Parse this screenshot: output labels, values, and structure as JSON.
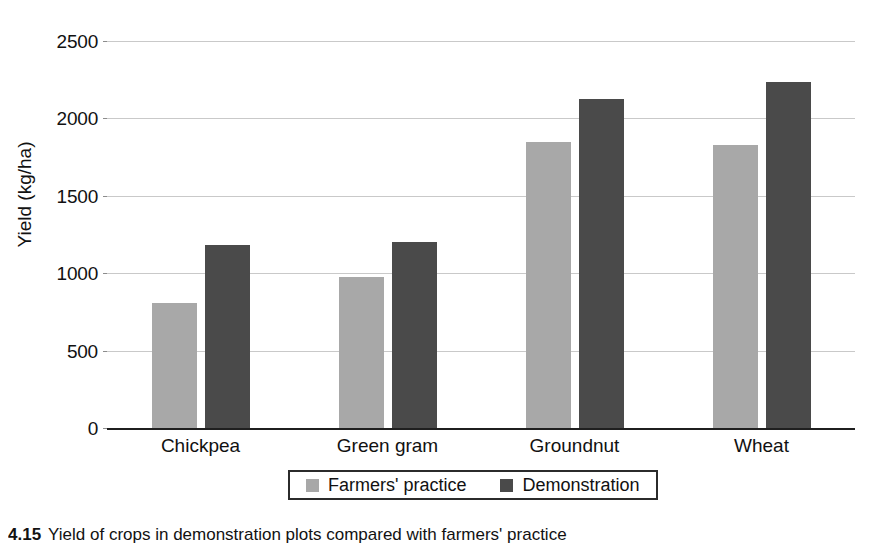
{
  "chart_data": {
    "type": "bar",
    "title": "",
    "subtitle": "",
    "xlabel": "",
    "ylabel": "Yield (kg/ha)",
    "ylim": [
      0,
      2500
    ],
    "ytick_values": [
      0,
      500,
      1000,
      1500,
      2000,
      2500
    ],
    "ytick_labels": [
      "0",
      "500",
      "1000",
      "1500",
      "2000",
      "2500"
    ],
    "grid": true,
    "grid_axis": "y",
    "legend_position": "bottom-center",
    "categories": [
      "Chickpea",
      "Green gram",
      "Groundnut",
      "Wheat"
    ],
    "series": [
      {
        "name": "Farmers' practice",
        "color": "#a8a8a8",
        "values": [
          810,
          975,
          1850,
          1830
        ]
      },
      {
        "name": "Demonstration",
        "color": "#4a4a4a",
        "values": [
          1185,
          1200,
          2125,
          2235
        ]
      }
    ]
  },
  "caption": {
    "number": "4.15",
    "text": "Yield of crops in demonstration plots compared with farmers' practice"
  },
  "colors": {
    "farmers_practice": "#a8a8a8",
    "demonstration": "#4a4a4a",
    "gridline": "#c9c9c9",
    "axis": "#1f1f1f",
    "background": "#ffffff"
  }
}
